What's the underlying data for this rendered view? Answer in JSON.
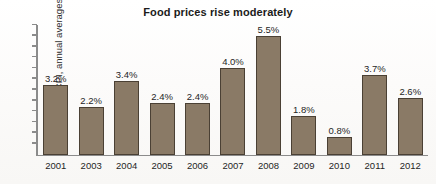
{
  "chart_data": {
    "type": "bar",
    "title": "Food prices rise moderately",
    "xlabel": "",
    "ylabel": "CPI, annual averages",
    "categories": [
      "2001",
      "2003",
      "2004",
      "2005",
      "2006",
      "2007",
      "2008",
      "2009",
      "2010",
      "2011",
      "2012"
    ],
    "values": [
      3.2,
      2.2,
      3.4,
      2.4,
      2.4,
      4.0,
      5.5,
      1.8,
      0.8,
      3.7,
      2.6
    ],
    "value_labels": [
      "3.2%",
      "2.2%",
      "3.4%",
      "2.4%",
      "2.4%",
      "4.0%",
      "5.5%",
      "1.8%",
      "0.8%",
      "3.7%",
      "2.6%"
    ],
    "ylim": [
      0,
      6.0
    ],
    "y_tick_values": [
      0,
      0.5,
      1.0,
      1.5,
      2.0,
      2.5,
      3.0,
      3.5,
      4.0,
      4.5,
      5.0,
      5.5,
      6.0
    ],
    "y_tick_labels": [],
    "grid": false,
    "legend": null,
    "bar_color": "#8a7a66",
    "bar_outline_color": "#4a4034",
    "axis_color": "#8b8b8b",
    "text_color": "#1f1f1f"
  }
}
